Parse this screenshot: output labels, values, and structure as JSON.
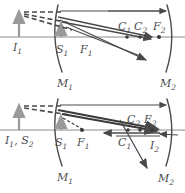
{
  "figure": {
    "panel_count": 2,
    "stroke_color": "#4a4a4a",
    "axis_color": "#8a8a8a",
    "object_color": "#9a9a9a"
  },
  "panels": [
    {
      "id": "top",
      "caption": "",
      "mirrors": [
        {
          "name": "M1",
          "label": "M",
          "sub": "1"
        },
        {
          "name": "M2",
          "label": "M",
          "sub": "2"
        }
      ],
      "points": [
        {
          "name": "I1",
          "label": "I",
          "sub": "1"
        },
        {
          "name": "S1",
          "label": "S",
          "sub": "1"
        },
        {
          "name": "F1",
          "label": "F",
          "sub": "1"
        },
        {
          "name": "C1",
          "label": "C",
          "sub": "1"
        },
        {
          "name": "C2",
          "label": "C",
          "sub": "2"
        },
        {
          "name": "F2",
          "label": "F",
          "sub": "2"
        }
      ]
    },
    {
      "id": "bottom",
      "caption": "",
      "mirrors": [
        {
          "name": "M1",
          "label": "M",
          "sub": "1"
        },
        {
          "name": "M2",
          "label": "M",
          "sub": "2"
        }
      ],
      "points": [
        {
          "name": "I1S2",
          "label": "I",
          "sub": "1",
          "label2": ", S",
          "sub2": "2"
        },
        {
          "name": "S1",
          "label": "S",
          "sub": "1"
        },
        {
          "name": "F1",
          "label": "F",
          "sub": "1"
        },
        {
          "name": "C1",
          "label": "C",
          "sub": "1"
        },
        {
          "name": "C2",
          "label": "C",
          "sub": "2"
        },
        {
          "name": "F2",
          "label": "F",
          "sub": "2"
        },
        {
          "name": "I2",
          "label": "I",
          "sub": "2"
        }
      ]
    }
  ],
  "labels": {
    "top": {
      "I1": {
        "t": "I",
        "s": "1"
      },
      "S1": {
        "t": "S",
        "s": "1"
      },
      "F1": {
        "t": "F",
        "s": "1"
      },
      "C1": {
        "t": "C",
        "s": "1"
      },
      "C2": {
        "t": "C",
        "s": "2"
      },
      "F2": {
        "t": "F",
        "s": "2"
      },
      "M1": {
        "t": "M",
        "s": "1"
      },
      "M2": {
        "t": "M",
        "s": "2"
      }
    },
    "bottom": {
      "I1S2_a": {
        "t": "I",
        "s": "1"
      },
      "I1S2_b": {
        "t": ", S",
        "s": "2"
      },
      "S1": {
        "t": "S",
        "s": "1"
      },
      "F1": {
        "t": "F",
        "s": "1"
      },
      "C1": {
        "t": "C",
        "s": "1"
      },
      "C2": {
        "t": "C",
        "s": "2"
      },
      "F2": {
        "t": "F",
        "s": "2"
      },
      "I2": {
        "t": "I",
        "s": "2"
      },
      "M1": {
        "t": "M",
        "s": "1"
      },
      "M2": {
        "t": "M",
        "s": "2"
      }
    }
  }
}
